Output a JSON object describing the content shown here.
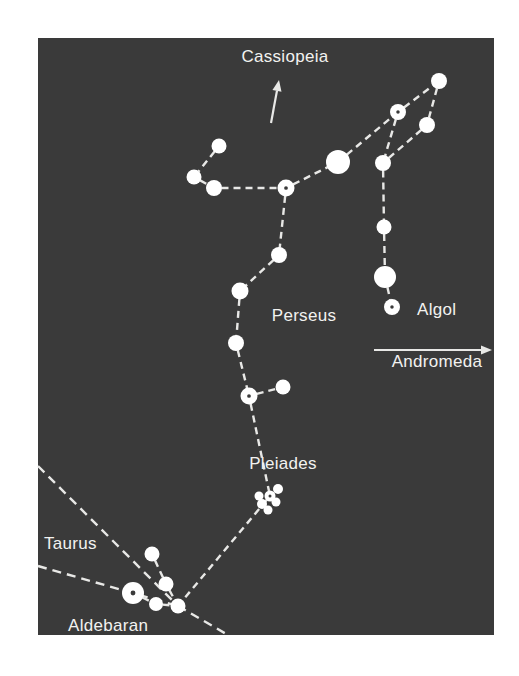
{
  "figure": {
    "background_color": "#ffffff",
    "sky_color": "#3a3a3a",
    "star_color": "#ffffff",
    "line_color": "#e8e8e6",
    "label_color": "#f2f2f0",
    "sky_rect": {
      "x": 38,
      "y": 38,
      "width": 456,
      "height": 597
    }
  },
  "labels": {
    "cassiopeia": "Cassiopeia",
    "perseus": "Perseus",
    "algol": "Algol",
    "andromeda": "Andromeda",
    "pleiades": "Pleiades",
    "taurus": "Taurus",
    "aldebaran": "Aldebaran"
  },
  "chart_data": {
    "type": "scatter",
    "xlabel": "",
    "ylabel": "",
    "xlim": [
      38,
      494
    ],
    "ylim": [
      38,
      635
    ],
    "grid": false,
    "legend": "none",
    "annotations": [
      {
        "name": "cassiopeia",
        "text": "Cassiopeia",
        "x": 285,
        "y": 62,
        "anchor": "middle"
      },
      {
        "name": "perseus",
        "text": "Perseus",
        "x": 304,
        "y": 321,
        "anchor": "middle"
      },
      {
        "name": "algol",
        "text": "Algol",
        "x": 417,
        "y": 315,
        "anchor": "start"
      },
      {
        "name": "andromeda",
        "text": "Andromeda",
        "x": 437,
        "y": 367,
        "anchor": "middle"
      },
      {
        "name": "pleiades",
        "text": "Pleiades",
        "x": 283,
        "y": 469,
        "anchor": "middle"
      },
      {
        "name": "taurus",
        "text": "Taurus",
        "x": 44,
        "y": 549,
        "anchor": "start"
      },
      {
        "name": "aldebaran",
        "text": "Aldebaran",
        "x": 68,
        "y": 631,
        "anchor": "start"
      }
    ],
    "arrows": [
      {
        "name": "cassiopeia-arrow",
        "x1": 271,
        "y1": 123,
        "x2": 279,
        "y2": 80,
        "direction": "up"
      },
      {
        "name": "andromeda-arrow",
        "x1": 374,
        "y1": 350,
        "x2": 492,
        "y2": 350,
        "direction": "right"
      }
    ],
    "stars": [
      {
        "id": "s1",
        "x": 219,
        "y": 146,
        "r": 7.5,
        "center_dot": false
      },
      {
        "id": "s2",
        "x": 194,
        "y": 177,
        "r": 7.5,
        "center_dot": false
      },
      {
        "id": "s3",
        "x": 214,
        "y": 188,
        "r": 8.0,
        "center_dot": false
      },
      {
        "id": "s4",
        "x": 286,
        "y": 188,
        "r": 8.5,
        "center_dot": true
      },
      {
        "id": "s5",
        "x": 338,
        "y": 162,
        "r": 12.0,
        "center_dot": false
      },
      {
        "id": "s6",
        "x": 398,
        "y": 112,
        "r": 8.0,
        "center_dot": true
      },
      {
        "id": "s7",
        "x": 439,
        "y": 81,
        "r": 8.0,
        "center_dot": false
      },
      {
        "id": "s8",
        "x": 427,
        "y": 125,
        "r": 8.0,
        "center_dot": false
      },
      {
        "id": "s9",
        "x": 383,
        "y": 163,
        "r": 8.0,
        "center_dot": false
      },
      {
        "id": "s10",
        "x": 384,
        "y": 227,
        "r": 7.5,
        "center_dot": false
      },
      {
        "id": "s11",
        "x": 385,
        "y": 277,
        "r": 11.0,
        "center_dot": false
      },
      {
        "id": "s12",
        "x": 392,
        "y": 307,
        "r": 8.0,
        "center_dot": true
      },
      {
        "id": "s13",
        "x": 279,
        "y": 255,
        "r": 8.0,
        "center_dot": false
      },
      {
        "id": "s14",
        "x": 240,
        "y": 291,
        "r": 8.5,
        "center_dot": false
      },
      {
        "id": "s15",
        "x": 236,
        "y": 343,
        "r": 8.0,
        "center_dot": false
      },
      {
        "id": "s16",
        "x": 249,
        "y": 396,
        "r": 8.5,
        "center_dot": true
      },
      {
        "id": "s17",
        "x": 283,
        "y": 387,
        "r": 7.5,
        "center_dot": false
      },
      {
        "id": "p1",
        "x": 262,
        "y": 504,
        "r": 5.0,
        "center_dot": false
      },
      {
        "id": "p2",
        "x": 270,
        "y": 496,
        "r": 5.5,
        "center_dot": true
      },
      {
        "id": "p3",
        "x": 278,
        "y": 489,
        "r": 5.0,
        "center_dot": false
      },
      {
        "id": "p4",
        "x": 276,
        "y": 502,
        "r": 4.5,
        "center_dot": false
      },
      {
        "id": "p5",
        "x": 268,
        "y": 510,
        "r": 4.5,
        "center_dot": false
      },
      {
        "id": "p6",
        "x": 259,
        "y": 496,
        "r": 4.5,
        "center_dot": false
      },
      {
        "id": "t1",
        "x": 152,
        "y": 554,
        "r": 7.5,
        "center_dot": false
      },
      {
        "id": "t2",
        "x": 166,
        "y": 584,
        "r": 7.5,
        "center_dot": false
      },
      {
        "id": "t3",
        "x": 133,
        "y": 593,
        "r": 11.0,
        "center_dot": true
      },
      {
        "id": "t4",
        "x": 156,
        "y": 604,
        "r": 7.0,
        "center_dot": false
      },
      {
        "id": "t5",
        "x": 178,
        "y": 606,
        "r": 7.5,
        "center_dot": false
      }
    ],
    "links": [
      {
        "from": "s1",
        "to": "s2"
      },
      {
        "from": "s2",
        "to": "s3"
      },
      {
        "from": "s3",
        "to": "s4"
      },
      {
        "from": "s4",
        "to": "s5"
      },
      {
        "from": "s5",
        "to": "s6"
      },
      {
        "from": "s6",
        "to": "s7"
      },
      {
        "from": "s7",
        "to": "s8"
      },
      {
        "from": "s8",
        "to": "s9"
      },
      {
        "from": "s6",
        "to": "s9"
      },
      {
        "from": "s9",
        "to": "s10"
      },
      {
        "from": "s10",
        "to": "s11"
      },
      {
        "from": "s11",
        "to": "s12"
      },
      {
        "from": "s4",
        "to": "s13"
      },
      {
        "from": "s13",
        "to": "s14"
      },
      {
        "from": "s14",
        "to": "s15"
      },
      {
        "from": "s15",
        "to": "s16"
      },
      {
        "from": "s16",
        "to": "s17"
      },
      {
        "from": "s16",
        "to": "p2"
      },
      {
        "from": "p2",
        "to": "t5"
      },
      {
        "from": "t1",
        "to": "t2"
      },
      {
        "from": "t2",
        "to": "t5"
      },
      {
        "from": "t3",
        "to": "t4"
      },
      {
        "from": "t4",
        "to": "t5"
      }
    ],
    "boundary_lines": [
      {
        "name": "taurus-boundary-upper",
        "x1": 38,
        "y1": 466,
        "x2": 178,
        "y2": 606
      },
      {
        "name": "taurus-boundary-lower",
        "x1": 38,
        "y1": 566,
        "x2": 178,
        "y2": 606
      },
      {
        "name": "taurus-boundary-exit",
        "x1": 178,
        "y1": 606,
        "x2": 228,
        "y2": 635
      }
    ]
  }
}
